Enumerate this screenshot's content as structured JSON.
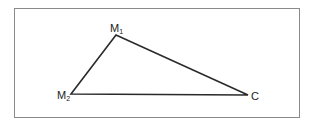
{
  "diagram": {
    "type": "triangle",
    "vertices": [
      {
        "id": "M1",
        "label": "M",
        "subscript": "1",
        "x": 116,
        "y": 35
      },
      {
        "id": "M2",
        "label": "M",
        "subscript": "2",
        "x": 71,
        "y": 94
      },
      {
        "id": "C",
        "label": "C",
        "subscript": "",
        "x": 248,
        "y": 95
      }
    ],
    "edges": [
      [
        "M1",
        "M2"
      ],
      [
        "M1",
        "C"
      ],
      [
        "M2",
        "C"
      ]
    ],
    "stroke_color": "#2a2a2a",
    "frame_color": "#8a8a8a"
  }
}
